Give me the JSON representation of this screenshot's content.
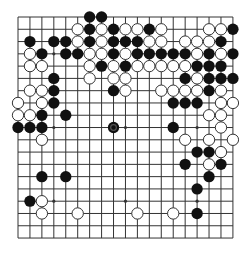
{
  "game": "go",
  "board": {
    "size": 19,
    "origin": {
      "x": 18,
      "y": 17
    },
    "spacing": {
      "x": 11.94,
      "y": 12.28
    },
    "line_color": "#333333",
    "background": "#ffffff",
    "star_points": [
      [
        3,
        3
      ],
      [
        9,
        3
      ],
      [
        15,
        3
      ],
      [
        3,
        9
      ],
      [
        9,
        9
      ],
      [
        15,
        9
      ],
      [
        3,
        15
      ],
      [
        9,
        15
      ],
      [
        15,
        15
      ]
    ]
  },
  "colors": {
    "black": "#111111",
    "white": "#ffffff",
    "white_stroke": "#333333",
    "marker": "#555555"
  },
  "last_move": {
    "color": "black",
    "col": 8,
    "row": 9
  },
  "stones": {
    "black": [
      [
        6,
        0
      ],
      [
        7,
        0
      ],
      [
        6,
        1
      ],
      [
        8,
        1
      ],
      [
        11,
        1
      ],
      [
        18,
        1
      ],
      [
        1,
        2
      ],
      [
        3,
        2
      ],
      [
        4,
        2
      ],
      [
        6,
        2
      ],
      [
        8,
        2
      ],
      [
        9,
        2
      ],
      [
        10,
        2
      ],
      [
        17,
        2
      ],
      [
        2,
        3
      ],
      [
        4,
        3
      ],
      [
        5,
        3
      ],
      [
        8,
        3
      ],
      [
        10,
        3
      ],
      [
        11,
        3
      ],
      [
        12,
        3
      ],
      [
        13,
        3
      ],
      [
        14,
        3
      ],
      [
        16,
        3
      ],
      [
        18,
        3
      ],
      [
        7,
        4
      ],
      [
        9,
        4
      ],
      [
        15,
        4
      ],
      [
        16,
        4
      ],
      [
        17,
        4
      ],
      [
        3,
        5
      ],
      [
        14,
        5
      ],
      [
        16,
        5
      ],
      [
        17,
        5
      ],
      [
        18,
        5
      ],
      [
        3,
        6
      ],
      [
        8,
        6
      ],
      [
        16,
        6
      ],
      [
        3,
        7
      ],
      [
        13,
        7
      ],
      [
        14,
        7
      ],
      [
        15,
        7
      ],
      [
        2,
        8
      ],
      [
        4,
        8
      ],
      [
        0,
        9
      ],
      [
        1,
        9
      ],
      [
        2,
        9
      ],
      [
        8,
        9
      ],
      [
        13,
        9
      ],
      [
        15,
        11
      ],
      [
        16,
        11
      ],
      [
        14,
        12
      ],
      [
        17,
        12
      ],
      [
        2,
        13
      ],
      [
        4,
        13
      ],
      [
        16,
        13
      ],
      [
        15,
        14
      ],
      [
        1,
        15
      ],
      [
        15,
        16
      ]
    ],
    "white": [
      [
        5,
        1
      ],
      [
        7,
        1
      ],
      [
        9,
        1
      ],
      [
        10,
        1
      ],
      [
        12,
        1
      ],
      [
        16,
        1
      ],
      [
        17,
        1
      ],
      [
        5,
        2
      ],
      [
        7,
        2
      ],
      [
        11,
        2
      ],
      [
        12,
        2
      ],
      [
        14,
        2
      ],
      [
        15,
        2
      ],
      [
        16,
        2
      ],
      [
        1,
        3
      ],
      [
        6,
        3
      ],
      [
        7,
        3
      ],
      [
        9,
        3
      ],
      [
        15,
        3
      ],
      [
        17,
        3
      ],
      [
        1,
        4
      ],
      [
        2,
        4
      ],
      [
        6,
        4
      ],
      [
        8,
        4
      ],
      [
        10,
        4
      ],
      [
        11,
        4
      ],
      [
        12,
        4
      ],
      [
        13,
        4
      ],
      [
        14,
        4
      ],
      [
        6,
        5
      ],
      [
        8,
        5
      ],
      [
        9,
        5
      ],
      [
        15,
        5
      ],
      [
        1,
        6
      ],
      [
        2,
        6
      ],
      [
        9,
        6
      ],
      [
        12,
        6
      ],
      [
        13,
        6
      ],
      [
        14,
        6
      ],
      [
        15,
        6
      ],
      [
        17,
        6
      ],
      [
        0,
        7
      ],
      [
        2,
        7
      ],
      [
        17,
        7
      ],
      [
        18,
        7
      ],
      [
        0,
        8
      ],
      [
        1,
        8
      ],
      [
        16,
        8
      ],
      [
        17,
        8
      ],
      [
        17,
        9
      ],
      [
        2,
        10
      ],
      [
        14,
        10
      ],
      [
        16,
        10
      ],
      [
        18,
        10
      ],
      [
        17,
        11
      ],
      [
        16,
        12
      ],
      [
        2,
        15
      ],
      [
        2,
        16
      ],
      [
        5,
        16
      ],
      [
        10,
        16
      ],
      [
        13,
        16
      ]
    ]
  }
}
